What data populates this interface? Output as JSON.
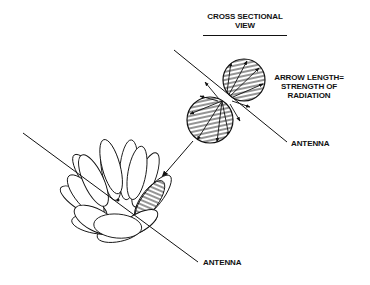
{
  "diagram": {
    "title": {
      "line1": "CROSS SECTIONAL",
      "line2": "VIEW"
    },
    "legend": {
      "line1": "ARROW LENGTH=",
      "line2": "STRENGTH OF",
      "line3": "RADIATION"
    },
    "labels": {
      "antenna_upper": "ANTENNA",
      "antenna_lower": "ANTENNA"
    },
    "components": [
      "cross-sectional view of radiation pattern (two hatched circular lobes)",
      "antenna line through cross section",
      "radiation vector arrows (length = strength of radiation)",
      "pointer arrow from cross section to 3D toroidal pattern",
      "3D toroidal (doughnut) radiation pattern around antenna",
      "antenna line through toroid"
    ],
    "colors": {
      "ink": "#111111",
      "background": "#ffffff"
    }
  }
}
